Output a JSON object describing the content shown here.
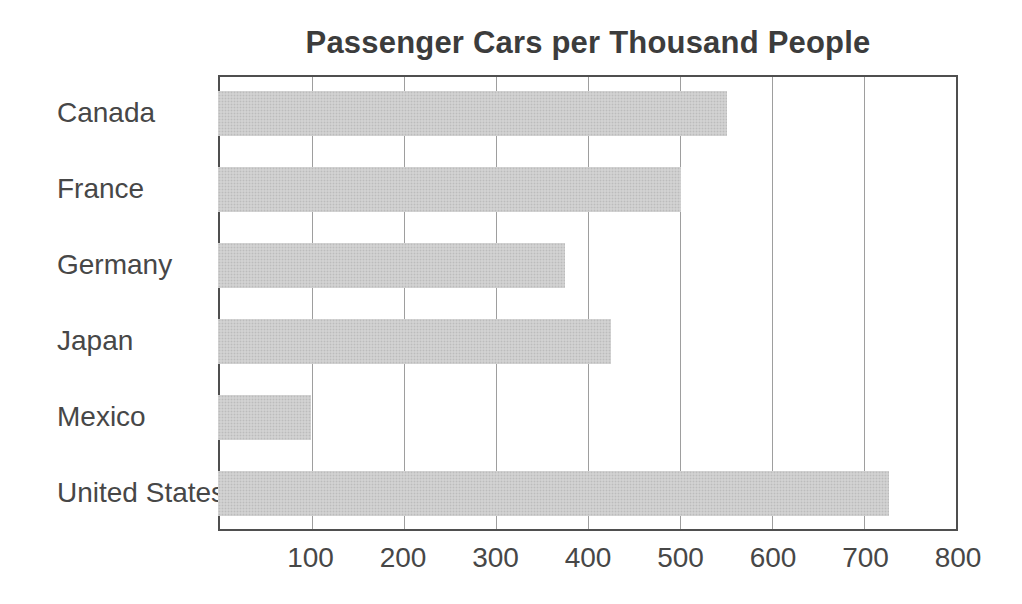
{
  "title": "Passenger Cars per Thousand People",
  "chart_data": {
    "type": "bar",
    "orientation": "horizontal",
    "title": "Passenger Cars per Thousand People",
    "categories": [
      "Canada",
      "France",
      "Germany",
      "Japan",
      "Mexico",
      "United States"
    ],
    "values": [
      550,
      500,
      375,
      425,
      100,
      725
    ],
    "xlabel": "",
    "ylabel": "",
    "xlim": [
      0,
      800
    ],
    "xticks": [
      100,
      200,
      300,
      400,
      500,
      600,
      700,
      800
    ],
    "grid": "vertical-gridlines",
    "legend": "none",
    "colors": {
      "bar_fill": "#d2d2d2",
      "bar_halftone_dot": "#bcbcbc",
      "plot_border": "#4f4f4f",
      "gridline": "#9e9e9e",
      "text": "#474747",
      "background": "#ffffff"
    }
  }
}
